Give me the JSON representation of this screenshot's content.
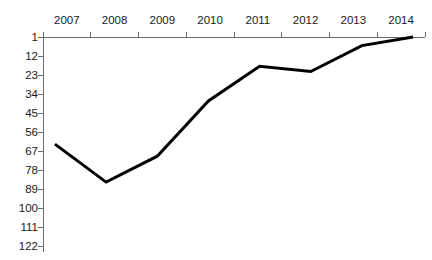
{
  "chart_data": {
    "type": "line",
    "title": "",
    "xlabel": "",
    "ylabel": "",
    "categories": [
      "2007",
      "2008",
      "2009",
      "2010",
      "2011",
      "2012",
      "2013",
      "2014"
    ],
    "values": [
      63,
      85,
      70,
      38,
      18,
      21,
      6,
      1
    ],
    "series": [
      {
        "name": "Rank",
        "values": [
          63,
          85,
          70,
          38,
          18,
          21,
          6,
          1
        ],
        "color": "#000000"
      }
    ],
    "y_ticks": [
      1,
      12,
      23,
      34,
      45,
      56,
      67,
      78,
      89,
      100,
      111,
      122
    ],
    "y_tick_labels": [
      "1",
      "12",
      "23",
      "34",
      "45",
      "56",
      "67",
      "78",
      "89",
      "100",
      "111",
      "122"
    ],
    "x_tick_labels": [
      "2007",
      "2008",
      "2009",
      "2010",
      "2011",
      "2012",
      "2013",
      "2014"
    ],
    "ylim": [
      1,
      122
    ],
    "y_inverted": true,
    "grid": false,
    "legend": false,
    "legend_position": "none",
    "axis_color": "#6d6d6d",
    "line_color": "#000000",
    "line_width": 3,
    "background": "#ffffff"
  },
  "axes": {
    "x_axis_name": "year-axis",
    "y_axis_name": "rank-axis"
  },
  "clipped_header": {
    "text": ""
  }
}
